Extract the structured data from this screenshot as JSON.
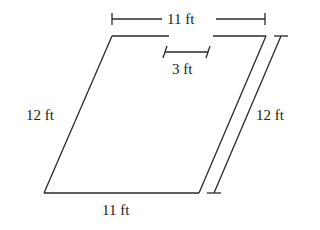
{
  "figure": {
    "shape": "parallelogram with gap in top edge",
    "labels": {
      "top_width": "11 ft",
      "gap_width": "3 ft",
      "left_side": "12 ft",
      "right_side": "12 ft",
      "bottom_width": "11 ft"
    }
  }
}
